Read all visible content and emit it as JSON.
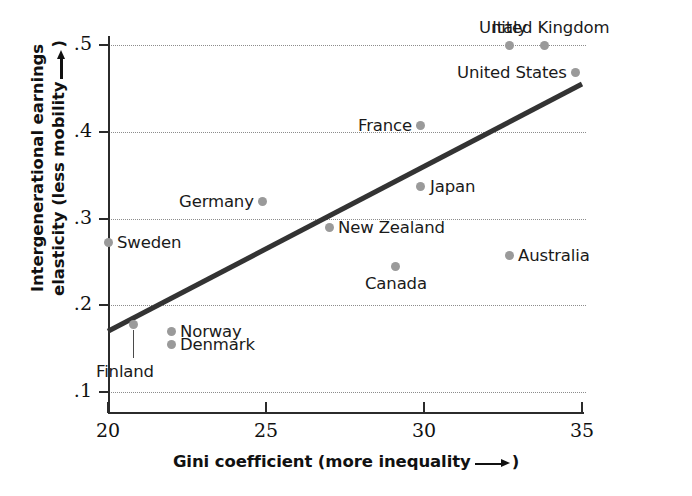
{
  "chart_data": {
    "type": "scatter",
    "title": "",
    "xlabel": "Gini coefficient (more inequality —→)",
    "xlabel_text": "Gini coefficient (more inequality",
    "xlabel_tail": ")",
    "ylabel_line1": "Intergenerational earnings",
    "ylabel_line2_text": "elasticity (less mobility",
    "ylabel_line2_tail": ")",
    "xlim": [
      20,
      35
    ],
    "ylim": [
      0.1,
      0.5
    ],
    "xticks": [
      20,
      25,
      30,
      35
    ],
    "xtick_labels": [
      "20",
      "25",
      "30",
      "35"
    ],
    "yticks": [
      0.1,
      0.2,
      0.3,
      0.4,
      0.5
    ],
    "ytick_labels": [
      ".1",
      ".2",
      ".3",
      ".4",
      ".5"
    ],
    "grid": "horizontal-dotted",
    "legend": "none",
    "dot_color": "#9a9a9a",
    "line_color": "#333333",
    "points": [
      {
        "name": "Sweden",
        "x": 20.0,
        "y": 0.272,
        "label_side": "right"
      },
      {
        "name": "Finland",
        "x": 20.8,
        "y": 0.178,
        "label_side": "below-leader"
      },
      {
        "name": "Norway",
        "x": 22.0,
        "y": 0.17,
        "label_side": "right"
      },
      {
        "name": "Denmark",
        "x": 22.0,
        "y": 0.155,
        "label_side": "right"
      },
      {
        "name": "Germany",
        "x": 24.9,
        "y": 0.32,
        "label_side": "left"
      },
      {
        "name": "New Zealand",
        "x": 27.0,
        "y": 0.29,
        "label_side": "right"
      },
      {
        "name": "Canada",
        "x": 29.1,
        "y": 0.245,
        "label_side": "below"
      },
      {
        "name": "Japan",
        "x": 29.9,
        "y": 0.337,
        "label_side": "right"
      },
      {
        "name": "France",
        "x": 29.9,
        "y": 0.407,
        "label_side": "left"
      },
      {
        "name": "Italy",
        "x": 32.7,
        "y": 0.5,
        "label_side": "above"
      },
      {
        "name": "Australia",
        "x": 32.7,
        "y": 0.257,
        "label_side": "right"
      },
      {
        "name": "United Kingdom",
        "x": 33.8,
        "y": 0.5,
        "label_side": "above"
      },
      {
        "name": "United States",
        "x": 34.8,
        "y": 0.468,
        "label_side": "left"
      }
    ],
    "trendline": {
      "x0": 20.0,
      "y0": 0.17,
      "x1": 35.0,
      "y1": 0.455
    }
  }
}
